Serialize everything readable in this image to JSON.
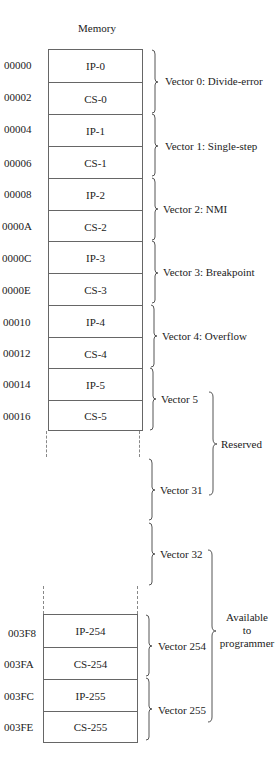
{
  "title": "Memory",
  "top_block": {
    "cells": [
      {
        "address": "00000",
        "label": "IP-0"
      },
      {
        "address": "00002",
        "label": "CS-0"
      },
      {
        "address": "00004",
        "label": "IP-1"
      },
      {
        "address": "00006",
        "label": "CS-1"
      },
      {
        "address": "00008",
        "label": "IP-2"
      },
      {
        "address": "0000A",
        "label": "CS-2"
      },
      {
        "address": "0000C",
        "label": "IP-3"
      },
      {
        "address": "0000E",
        "label": "CS-3"
      },
      {
        "address": "00010",
        "label": "IP-4"
      },
      {
        "address": "00012",
        "label": "CS-4"
      },
      {
        "address": "00014",
        "label": "IP-5"
      },
      {
        "address": "00016",
        "label": "CS-5"
      }
    ]
  },
  "bottom_block": {
    "cells": [
      {
        "address": "003F8",
        "label": "IP-254"
      },
      {
        "address": "003FA",
        "label": "CS-254"
      },
      {
        "address": "003FC",
        "label": "IP-255"
      },
      {
        "address": "003FE",
        "label": "CS-255"
      }
    ]
  },
  "vectors": [
    {
      "label": "Vector 0: Divide-error"
    },
    {
      "label": "Vector 1: Single-step"
    },
    {
      "label": "Vector 2: NMI"
    },
    {
      "label": "Vector 3: Breakpoint"
    },
    {
      "label": "Vector 4: Overflow"
    },
    {
      "label": "Vector 5"
    },
    {
      "label": "Vector 31"
    },
    {
      "label": "Vector 32"
    },
    {
      "label": "Vector 254"
    },
    {
      "label": "Vector 255"
    }
  ],
  "groups": {
    "reserved": "Reserved",
    "available": [
      "Available",
      "to",
      "programmer"
    ]
  }
}
